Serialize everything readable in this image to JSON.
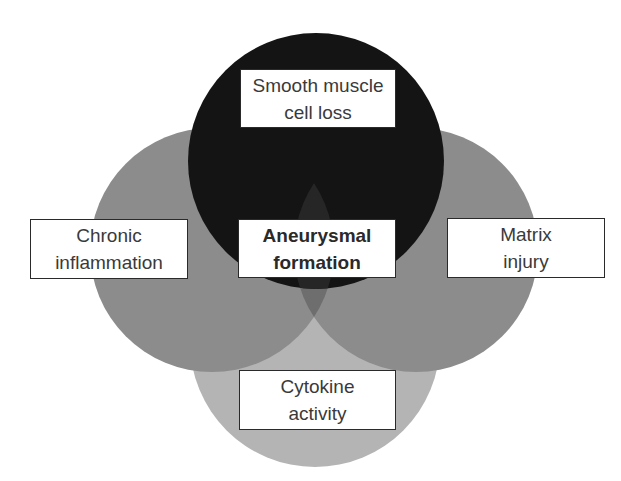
{
  "diagram": {
    "type": "venn",
    "center_label": {
      "line1": "Aneurysmal",
      "line2": "formation"
    },
    "circles": [
      {
        "id": "top",
        "line1": "Smooth muscle",
        "line2": "cell loss",
        "color": "#141414"
      },
      {
        "id": "left",
        "line1": "Chronic",
        "line2": "inflammation",
        "color": "#8c8c8c"
      },
      {
        "id": "right",
        "line1": "Matrix",
        "line2": "injury",
        "color": "#8c8c8c"
      },
      {
        "id": "bottom",
        "line1": "Cytokine",
        "line2": "activity",
        "color": "#b4b4b4"
      }
    ],
    "overlap_colors": {
      "left_right": "#6e6e6e",
      "bottom_side": "#8a8a8a",
      "top_any": "#1c1c1c"
    }
  }
}
